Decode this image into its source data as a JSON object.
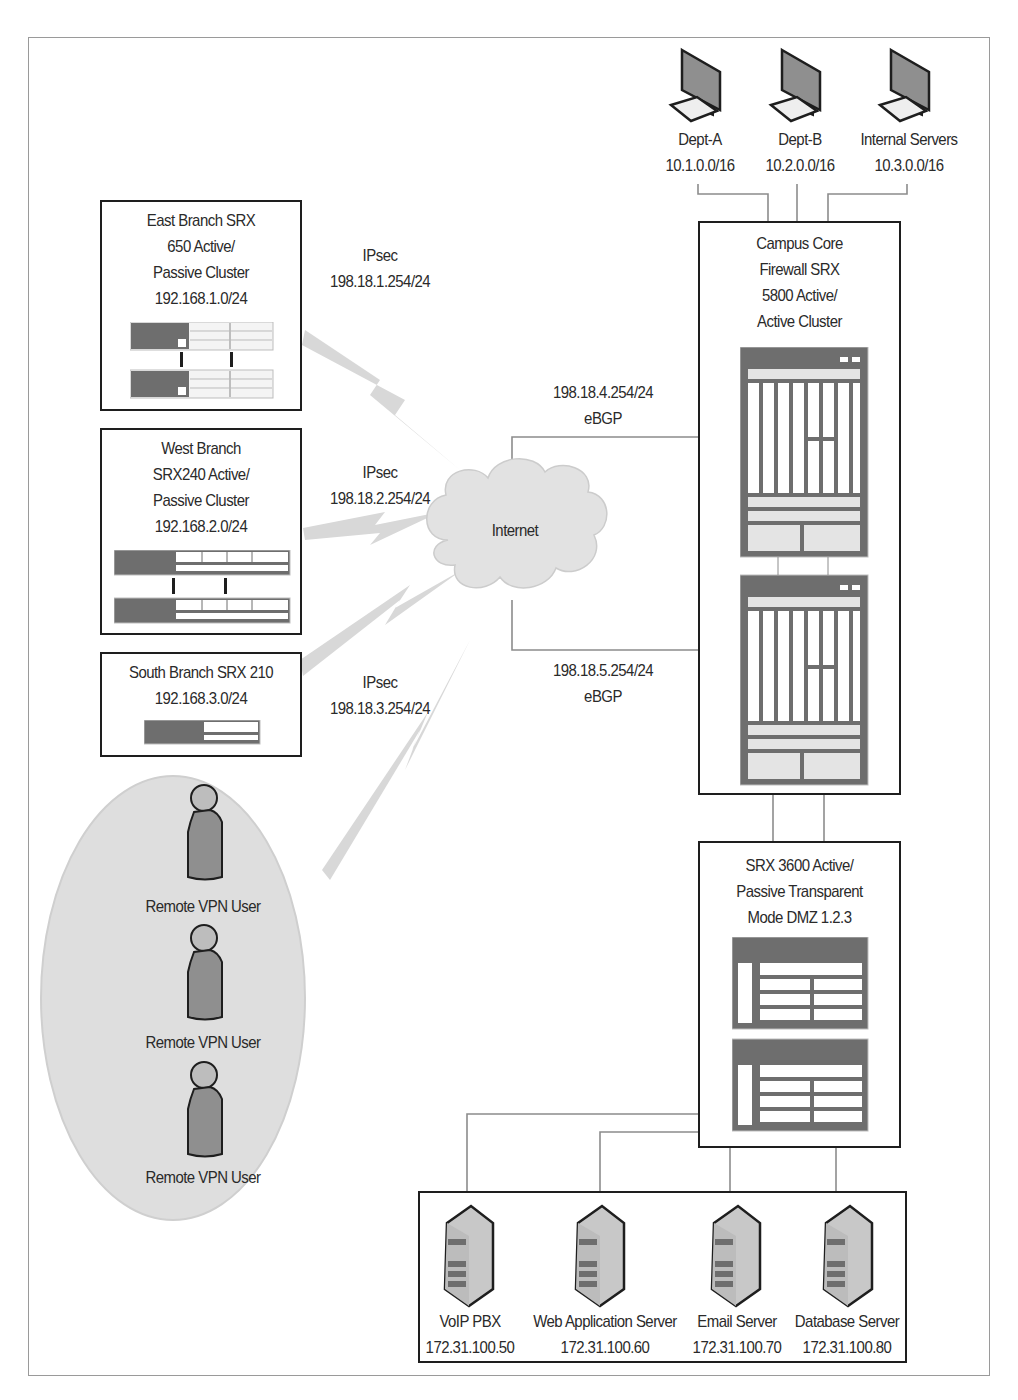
{
  "colors": {
    "box_border": "#1e1e1e",
    "line": "#8c8c8c",
    "device_dark": "#6e6e6e",
    "device_light": "#e4e4e4",
    "vpn_ellipse": "#dedede",
    "ipsec_bolt": "#d6d6d6",
    "cloud": "#e2e2e2"
  },
  "workstations": [
    {
      "name": "Dept-A",
      "subnet": "10.1.0.0/16",
      "icon": "desktop-computer-icon"
    },
    {
      "name": "Dept-B",
      "subnet": "10.2.0.0/16",
      "icon": "desktop-computer-icon"
    },
    {
      "name": "Internal Servers",
      "subnet": "10.3.0.0/16",
      "icon": "desktop-computer-icon"
    }
  ],
  "branches": {
    "east": {
      "lines": [
        "East Branch SRX",
        "650 Active/",
        "Passive Cluster",
        "192.168.1.0/24"
      ],
      "link": {
        "type": "IPsec",
        "ip": "198.18.1.254/24"
      }
    },
    "west": {
      "lines": [
        "West Branch",
        "SRX240 Active/",
        "Passive Cluster",
        "192.168.2.0/24"
      ],
      "link": {
        "type": "IPsec",
        "ip": "198.18.2.254/24"
      }
    },
    "south": {
      "lines": [
        "South Branch SRX 210",
        "192.168.3.0/24"
      ],
      "link": {
        "type": "IPsec",
        "ip": "198.18.3.254/24"
      }
    }
  },
  "internet": {
    "label": "Internet"
  },
  "ebgp_links": [
    {
      "ip": "198.18.4.254/24",
      "proto": "eBGP"
    },
    {
      "ip": "198.18.5.254/24",
      "proto": "eBGP"
    }
  ],
  "campus_core": {
    "lines": [
      "Campus Core",
      "Firewall SRX",
      "5800 Active/",
      "Active Cluster"
    ]
  },
  "dmz": {
    "lines": [
      "SRX 3600 Active/",
      "Passive Transparent",
      "Mode DMZ 1.2.3"
    ]
  },
  "vpn_users": [
    {
      "label": "Remote VPN User"
    },
    {
      "label": "Remote VPN User"
    },
    {
      "label": "Remote VPN User"
    }
  ],
  "servers": [
    {
      "name": "VoIP PBX",
      "ip": "172.31.100.50"
    },
    {
      "name": "Web Application Server",
      "ip": "172.31.100.60"
    },
    {
      "name": "Email Server",
      "ip": "172.31.100.70"
    },
    {
      "name": "Database Server",
      "ip": "172.31.100.80"
    }
  ]
}
